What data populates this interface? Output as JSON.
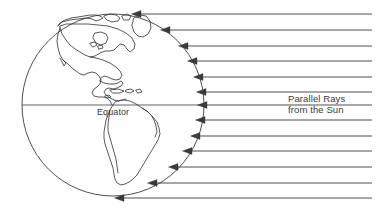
{
  "figure": {
    "background_color": "#ffffff",
    "line_color": "#3b3b3b",
    "width": 377,
    "height": 216
  },
  "globe": {
    "name": "earth-globe",
    "center_x": 113,
    "center_y": 105,
    "radius": 91,
    "equator_label": "Equator",
    "continents_depicted": "North America, Central America, South America, Greenland"
  },
  "equator": {
    "label": "Equator",
    "y": 105,
    "x_start": 22,
    "x_end": 204
  },
  "rays": {
    "label_line_1": "Parallel Rays",
    "label_line_2": "from the Sun",
    "count": 13,
    "direction": "right-to-left",
    "x_right_edge": 372,
    "y_positions": [
      14,
      30,
      46,
      61,
      77,
      92,
      105,
      120,
      136,
      151,
      167,
      183,
      198
    ]
  }
}
